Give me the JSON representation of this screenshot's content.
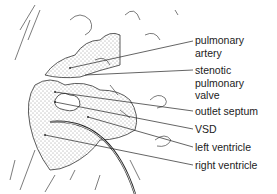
{
  "diagram": {
    "type": "anatomical-illustration",
    "labels": [
      {
        "id": "pulmonary-artery",
        "lines": [
          "pulmonary",
          "artery"
        ],
        "x": 195,
        "y": 34
      },
      {
        "id": "stenotic-pulmonary-valve",
        "lines": [
          "stenotic",
          "pulmonary",
          "valve"
        ],
        "x": 195,
        "y": 64
      },
      {
        "id": "outlet-septum",
        "lines": [
          "outlet septum"
        ],
        "x": 195,
        "y": 105
      },
      {
        "id": "vsd",
        "lines": [
          "VSD"
        ],
        "x": 195,
        "y": 123
      },
      {
        "id": "left-ventricle",
        "lines": [
          "left ventricle"
        ],
        "x": 195,
        "y": 141
      },
      {
        "id": "right-ventricle",
        "lines": [
          "right ventricle"
        ],
        "x": 195,
        "y": 159
      }
    ],
    "colors": {
      "ink": "#222222",
      "background": "#ffffff"
    }
  }
}
